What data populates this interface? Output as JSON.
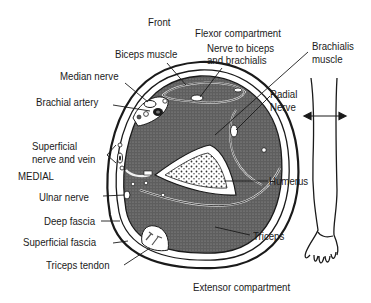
{
  "diagram": {
    "labels": {
      "front": "Front",
      "flexor_compartment": "Flexor compartment",
      "biceps_muscle": "Biceps muscle",
      "nerve_to_biceps_line1": "Nerve to biceps",
      "nerve_to_biceps_line2": "and brachialis",
      "brachialis_line1": "Brachialis",
      "brachialis_line2": "muscle",
      "median_nerve": "Median nerve",
      "brachial_artery": "Brachial artery",
      "radial_nerve_line1": "Radial",
      "radial_nerve_line2": "Nerve",
      "superficial_nerve_line1": "Superficial",
      "superficial_nerve_line2": "nerve and vein",
      "medial": "MEDIAL",
      "humerus": "Humerus",
      "ulnar_nerve": "Ulnar nerve",
      "deep_fascia": "Deep fascia",
      "superficial_fascia": "Superficial fascia",
      "triceps": "Triceps",
      "triceps_tendon": "Triceps tendon",
      "extensor_compartment": "Extensor compartment"
    },
    "icons": {
      "arm_outline": "arm-silhouette-icon",
      "section_arrow": "double-arrow-icon"
    },
    "colors": {
      "ink": "#1a1a1a",
      "muscle_fill": "#6a6a6a",
      "bone_fill": "#ffffff",
      "background": "#ffffff"
    }
  }
}
